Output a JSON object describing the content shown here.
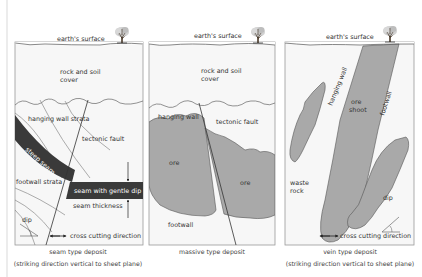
{
  "colors": {
    "box_fill": "#f7f7f7",
    "box_stroke": "#9a9a9a",
    "ore_gray": "#a9a9a9",
    "seam_dark": "#3a3a3a",
    "line": "#555555",
    "text": "#333333"
  },
  "panels": [
    {
      "id": "seam",
      "surface_label": "earth's surface",
      "cover_label_1": "rock and soil",
      "cover_label_2": "cover",
      "hanging_wall_label": "hanging wall strata",
      "fault_label": "tectonic fault",
      "steep_seam_label": "steep seam",
      "footwall_label": "footwall strata",
      "gentle_seam_label": "seam with gentle dip",
      "thickness_label": "seam thickness",
      "dip_label": "dip",
      "cross_cut_label": "cross cutting  direction",
      "caption_1": "seam type deposit",
      "caption_2": "(striking direction vertical to sheet plane)"
    },
    {
      "id": "massive",
      "surface_label": "earth's surface",
      "cover_label_1": "rock and soil",
      "cover_label_2": "cover",
      "hanging_wall_label": "hanging wall",
      "fault_label": "tectonic fault",
      "ore_label_1": "ore",
      "ore_label_2": "ore",
      "footwall_label": "footwall",
      "caption_1": "massive type deposit"
    },
    {
      "id": "vein",
      "surface_label": "earth's surface",
      "hanging_wall_label": "hanging wall",
      "ore_shoot_label_1": "ore",
      "ore_shoot_label_2": "shoot",
      "footwall_label": "footwall",
      "waste_label_1": "waste",
      "waste_label_2": "rock",
      "dip_label": "dip",
      "cross_cut_label": "cross cutting direction",
      "caption_1": "vein type deposit",
      "caption_2": "(striking direction vertical to sheet plane)"
    }
  ]
}
